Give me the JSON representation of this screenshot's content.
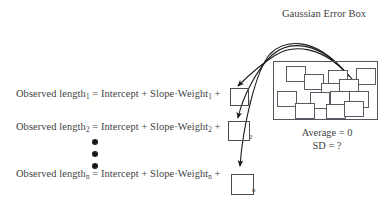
{
  "diagram": {
    "title": "Gaussian Error Box",
    "background_color": "#ffffff",
    "ink_color": "#3f3f3f",
    "box_stroke_color": "#4a4a55",
    "arrow_color": "#1a1a1a",
    "equations": [
      {
        "id": "eq-1",
        "prefix": "Observed length",
        "index": "1",
        "body": " = Intercept + Slope·Weight",
        "index2": "1",
        "suffix": " +",
        "full_text": "Observed length₁ = Intercept + Slope·Weight₁ +"
      },
      {
        "id": "eq-2",
        "prefix": "Observed length",
        "index": "2",
        "body": " = Intercept + Slope·Weight",
        "index2": "2",
        "suffix": " +",
        "full_text": "Observed length₂ = Intercept + Slope·Weight₂ +"
      },
      {
        "id": "eq-n",
        "prefix": "Observed length",
        "index": "n",
        "body": " = Intercept + Slope·Weight",
        "index2": "n",
        "suffix": " +",
        "full_text": "Observed lengthₙ = Intercept + Slope·Weightₙ +"
      }
    ],
    "residual_boxes": [
      {
        "label": "1"
      },
      {
        "label": "2"
      },
      {
        "label": "n"
      }
    ],
    "vertical_ellipsis_count": 3,
    "stats": {
      "average_label": "Average = 0",
      "sd_label": "SD = ?"
    },
    "error_box": {
      "x": 273,
      "y": 61,
      "width": 105,
      "height": 59,
      "tickets": [
        {
          "x": 13,
          "y": 5,
          "w": 19,
          "h": 15,
          "rot": 0
        },
        {
          "x": 31,
          "y": 13,
          "w": 19,
          "h": 15,
          "rot": 0
        },
        {
          "x": 55,
          "y": 9,
          "w": 19,
          "h": 16,
          "rot": 0
        },
        {
          "x": 83,
          "y": 7,
          "w": 19,
          "h": 16,
          "rot": 0
        },
        {
          "x": 48,
          "y": 22,
          "w": 19,
          "h": 16,
          "rot": 0
        },
        {
          "x": 66,
          "y": 18,
          "w": 19,
          "h": 16,
          "rot": 0
        },
        {
          "x": 4,
          "y": 30,
          "w": 19,
          "h": 15,
          "rot": 0
        },
        {
          "x": 37,
          "y": 31,
          "w": 19,
          "h": 16,
          "rot": 0
        },
        {
          "x": 57,
          "y": 30,
          "w": 19,
          "h": 16,
          "rot": 0
        },
        {
          "x": 76,
          "y": 30,
          "w": 19,
          "h": 16,
          "rot": 0
        },
        {
          "x": 22,
          "y": 42,
          "w": 19,
          "h": 15,
          "rot": 0
        },
        {
          "x": 53,
          "y": 43,
          "w": 19,
          "h": 14,
          "rot": 0
        },
        {
          "x": 71,
          "y": 40,
          "w": 19,
          "h": 15,
          "rot": 0
        }
      ]
    },
    "arrows": {
      "count": 3,
      "description": "three curved arrows from the error box to each residual box"
    }
  }
}
